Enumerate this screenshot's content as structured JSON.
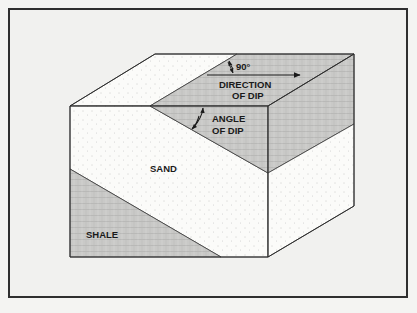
{
  "diagram": {
    "labels": {
      "right_angle": "90°",
      "direction_line1": "DIRECTION",
      "direction_line2": "OF DIP",
      "angle_line1": "ANGLE",
      "angle_line2": "OF DIP",
      "sand": "SAND",
      "shale": "SHALE"
    },
    "colors": {
      "background": "#f1f1ef",
      "frame": "#2f2f2f",
      "sand_fill": "#fbfbf9",
      "shale_fill": "#c9c9c7",
      "outline": "#3a3a3a"
    }
  }
}
